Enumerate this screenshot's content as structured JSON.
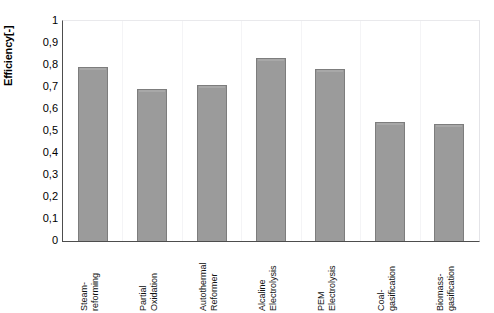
{
  "chart_data": {
    "type": "bar",
    "title": "",
    "xlabel": "",
    "ylabel": "Efficiency[-]",
    "ylim": [
      0,
      1
    ],
    "ytick_step": 0.1,
    "decimal_separator": ",",
    "grid": false,
    "legend": "none",
    "bar_color": "#9b9b9b",
    "bar_border_color": "#7d7d7d",
    "axis_color": "#4d4d4d",
    "categories": [
      "Steam-\nreforming",
      "Partial\nOxidation",
      "Autothermal\nReformer",
      "Alcaline\nElectrolysis",
      "PEM\nElectrolysis",
      "Coal-\ngasification",
      "Biomass-\ngasification"
    ],
    "values": [
      0.79,
      0.69,
      0.71,
      0.83,
      0.78,
      0.54,
      0.53
    ],
    "ytick_labels": [
      "1",
      "0,9",
      "0,8",
      "0,7",
      "0,6",
      "0,5",
      "0,4",
      "0,3",
      "0,2",
      "0,1",
      "0"
    ],
    "ytick_values": [
      1,
      0.9,
      0.8,
      0.7,
      0.6,
      0.5,
      0.4,
      0.3,
      0.2,
      0.1,
      0
    ]
  }
}
